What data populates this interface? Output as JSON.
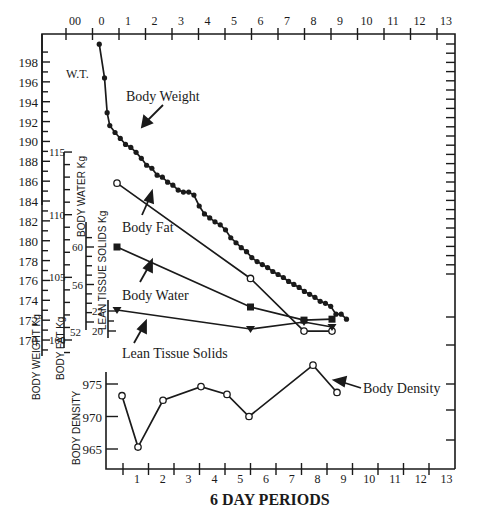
{
  "chart_data": [
    {
      "type": "line",
      "title": "",
      "xlabel": "6 DAY PERIODS",
      "x_top_tick_labels": [
        "00",
        "0",
        "1",
        "2",
        "3",
        "4",
        "5",
        "6",
        "7",
        "8",
        "9",
        "10",
        "11",
        "12",
        "13"
      ],
      "y_axes": [
        {
          "label": "BODY WEIGHT Kg",
          "short_label": "W.T.",
          "ticks": [
            170,
            172,
            174,
            176,
            178,
            180,
            182,
            184,
            186,
            188,
            190,
            192,
            194,
            196,
            198
          ]
        },
        {
          "label": "BODY FAT Kg",
          "ticks": [
            100,
            105,
            110,
            115
          ]
        },
        {
          "label": "BODY WATER Kg",
          "ticks": [
            52,
            56,
            60
          ]
        },
        {
          "label": "LEAN TISSUE SOLIDS Kg",
          "ticks": [
            20,
            22
          ]
        }
      ],
      "series": [
        {
          "name": "Body Weight",
          "marker": "filled-circle",
          "axis": "BODY WEIGHT Kg",
          "x": [
            0.2,
            0.4,
            0.5,
            0.6,
            0.8,
            1.0,
            1.2,
            1.4,
            1.6,
            1.8,
            2.0,
            2.2,
            2.4,
            2.6,
            2.8,
            3.0,
            3.2,
            3.4,
            3.6,
            3.8,
            4.0,
            4.2,
            4.4,
            4.6,
            4.8,
            5.0,
            5.2,
            5.4,
            5.6,
            5.8,
            6.0,
            6.2,
            6.4,
            6.6,
            6.8,
            7.0,
            7.2,
            7.4,
            7.6,
            7.8,
            8.0,
            8.2,
            8.4,
            8.6,
            8.8,
            9.0,
            9.2,
            9.4,
            9.6
          ],
          "values": [
            199.8,
            196.4,
            192.9,
            191.6,
            190.9,
            190.3,
            189.7,
            189.4,
            188.9,
            188.3,
            187.6,
            187.3,
            186.6,
            186.4,
            185.9,
            185.6,
            185.1,
            184.9,
            184.9,
            184.6,
            183.5,
            182.7,
            182.3,
            181.9,
            181.6,
            181.1,
            180.3,
            179.8,
            179.3,
            178.9,
            178.3,
            177.9,
            177.6,
            177.3,
            176.9,
            176.6,
            176.3,
            175.9,
            175.6,
            175.3,
            174.9,
            174.6,
            174.3,
            173.9,
            173.7,
            173.4,
            172.6,
            172.6,
            172.1
          ]
        },
        {
          "name": "Body Fat",
          "marker": "open-circle",
          "x": [
            0.3,
            5.5,
            8.0,
            9.6
          ],
          "values": [
            185.8,
            176.2,
            170.9,
            170.9
          ]
        },
        {
          "name": "Body Water",
          "marker": "filled-square",
          "x": [
            0.3,
            5.5,
            8.0,
            9.6
          ],
          "values": [
            60.0,
            53.6,
            52.2,
            52.3
          ]
        },
        {
          "name": "Lean Tissue Solids",
          "marker": "filled-triangle-down",
          "x": [
            0.3,
            5.5,
            8.0,
            9.6
          ],
          "values": [
            22.1,
            20.2,
            20.9,
            20.4
          ]
        }
      ],
      "annotations": [
        "W.T.",
        "Body Weight",
        "Body Fat",
        "Body Water",
        "Lean Tissue Solids"
      ]
    },
    {
      "type": "line",
      "title": "",
      "xlabel": "6 DAY PERIODS",
      "ylabel": "BODY DENSITY",
      "categories": [
        "1",
        "2",
        "3",
        "4",
        "5",
        "6",
        "7",
        "8",
        "9",
        "10",
        "11",
        "12",
        "13"
      ],
      "y_ticks": [
        965,
        970,
        975
      ],
      "series": [
        {
          "name": "Body Density",
          "marker": "open-circle",
          "x": [
            0.5,
            1.0,
            2.0,
            3.5,
            4.5,
            5.5,
            8.0,
            9.0
          ],
          "values": [
            973.2,
            965.3,
            972.5,
            974.6,
            973.4,
            970.0,
            977.9,
            973.7
          ]
        }
      ],
      "annotations": [
        "Body Density"
      ]
    }
  ],
  "labels": {
    "wt": "W.T.",
    "body_weight": "Body Weight",
    "body_fat": "Body Fat",
    "body_water": "Body Water",
    "lean_tissue": "Lean Tissue Solids",
    "body_density": "Body Density",
    "x_title": "6 DAY PERIODS",
    "axis_body_weight": "BODY WEIGHT Kg",
    "axis_body_fat": "BODY FAT Kg",
    "axis_body_water": "BODY WATER Kg",
    "axis_lean": "LEAN TISSUE SOLIDS Kg",
    "axis_density": "BODY DENSITY"
  },
  "ticks": {
    "top": [
      "00",
      "0",
      "1",
      "2",
      "3",
      "4",
      "5",
      "6",
      "7",
      "8",
      "9",
      "10",
      "11",
      "12",
      "13"
    ],
    "bottom": [
      "1",
      "2",
      "3",
      "4",
      "5",
      "6",
      "7",
      "8",
      "9",
      "10",
      "11",
      "12",
      "13"
    ],
    "weight": [
      "198",
      "196",
      "194",
      "192",
      "190",
      "188",
      "186",
      "184",
      "182",
      "180",
      "178",
      "176",
      "174",
      "172",
      "170"
    ],
    "fat": [
      "115",
      "110",
      "105",
      "100"
    ],
    "water": [
      "60",
      "56",
      "52"
    ],
    "lean": [
      "22",
      "20"
    ],
    "density": [
      "975",
      "970",
      "965"
    ]
  }
}
